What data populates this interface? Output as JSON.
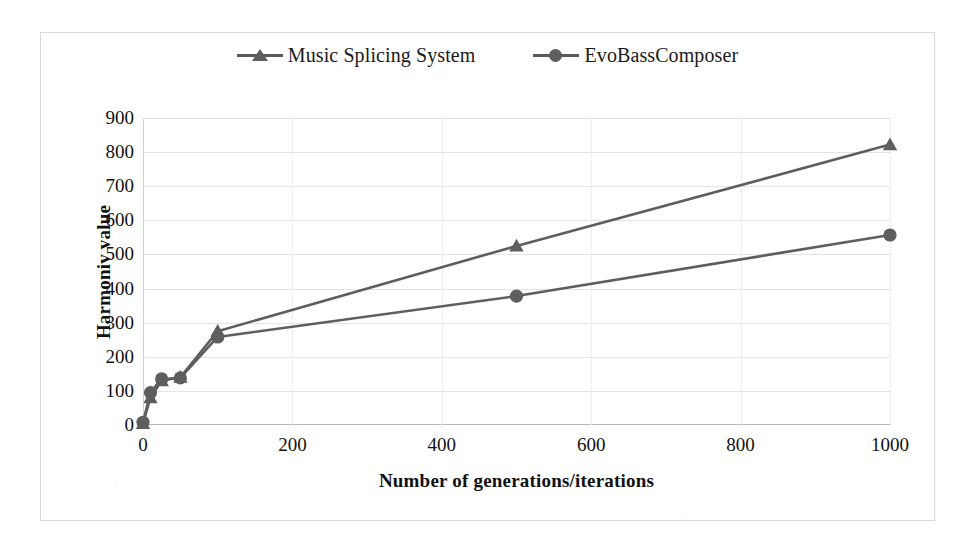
{
  "chart_data": {
    "type": "line",
    "title": "",
    "xlabel": "Number of generations/iterations",
    "ylabel": "Harmoniv value",
    "xlim": [
      0,
      1000
    ],
    "ylim": [
      0,
      900
    ],
    "xticks": [
      0,
      200,
      400,
      600,
      800,
      1000
    ],
    "yticks": [
      0,
      100,
      200,
      300,
      400,
      500,
      600,
      700,
      800,
      900
    ],
    "grid": "horizontal",
    "legend_position": "top-center",
    "x": [
      0,
      10,
      25,
      50,
      100,
      500,
      1000
    ],
    "series": [
      {
        "name": "Music Splicing System",
        "marker": "triangle",
        "color": "#5e5e5e",
        "values": [
          5,
          80,
          130,
          140,
          275,
          525,
          822
        ]
      },
      {
        "name": "EvoBassComposer",
        "marker": "circle",
        "color": "#5e5e5e",
        "values": [
          8,
          95,
          135,
          138,
          258,
          378,
          557
        ]
      }
    ]
  },
  "legend": {
    "entries": [
      {
        "label": "Music Splicing System",
        "marker": "triangle-marker-icon"
      },
      {
        "label": "EvoBassComposer",
        "marker": "circle-marker-icon"
      }
    ]
  },
  "axes": {
    "y_title": "Harmoniv value",
    "x_title": "Number of generations/iterations",
    "y_tick_labels": [
      "900",
      "800",
      "700",
      "600",
      "500",
      "400",
      "300",
      "200",
      "100",
      "0"
    ],
    "x_tick_labels": [
      "0",
      "200",
      "400",
      "600",
      "800",
      "1000"
    ]
  },
  "colors": {
    "series_line": "#5e5e5e",
    "gridline": "#e3e3e3",
    "axis_text": "#111111",
    "frame": "#d9d9d9",
    "background": "#ffffff"
  }
}
